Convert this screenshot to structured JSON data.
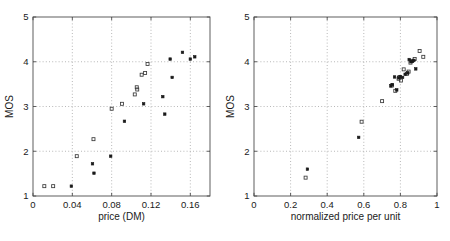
{
  "figure": {
    "title": "",
    "width": 450,
    "height": 241,
    "background": "#ffffff",
    "panel_count": 2
  },
  "chart_data": [
    {
      "type": "scatter",
      "id": "left-panel",
      "title": "",
      "xlabel": "price (DM)",
      "ylabel": "MOS",
      "xlim": [
        0,
        0.18
      ],
      "ylim": [
        1,
        5
      ],
      "xticks": [
        0,
        0.04,
        0.08,
        0.12,
        0.16
      ],
      "xticklabels": [
        "0",
        "0.04",
        "0.08",
        "0.12",
        "0.16"
      ],
      "yticks": [
        1,
        2,
        3,
        4,
        5
      ],
      "yticklabels": [
        "1",
        "2",
        "3",
        "4",
        "5"
      ],
      "grid": true,
      "legend": "none",
      "series": [
        {
          "name": "open-square",
          "marker": "square-open",
          "points": [
            {
              "x": 0.0115,
              "y": 1.22
            },
            {
              "x": 0.0205,
              "y": 1.22
            },
            {
              "x": 0.0445,
              "y": 1.89
            },
            {
              "x": 0.0615,
              "y": 2.27
            },
            {
              "x": 0.08,
              "y": 2.95
            },
            {
              "x": 0.0905,
              "y": 3.06
            },
            {
              "x": 0.1035,
              "y": 3.27
            },
            {
              "x": 0.1055,
              "y": 3.43
            },
            {
              "x": 0.106,
              "y": 3.38
            },
            {
              "x": 0.1105,
              "y": 3.71
            },
            {
              "x": 0.114,
              "y": 3.75
            },
            {
              "x": 0.1165,
              "y": 3.95
            }
          ]
        },
        {
          "name": "filled-dot",
          "marker": "square-filled",
          "points": [
            {
              "x": 0.039,
              "y": 1.22
            },
            {
              "x": 0.0605,
              "y": 1.72
            },
            {
              "x": 0.062,
              "y": 1.51
            },
            {
              "x": 0.079,
              "y": 1.89
            },
            {
              "x": 0.093,
              "y": 2.67
            },
            {
              "x": 0.1125,
              "y": 3.06
            },
            {
              "x": 0.132,
              "y": 3.22
            },
            {
              "x": 0.134,
              "y": 2.83
            },
            {
              "x": 0.1395,
              "y": 4.06
            },
            {
              "x": 0.1415,
              "y": 3.65
            },
            {
              "x": 0.152,
              "y": 4.21
            },
            {
              "x": 0.16,
              "y": 4.06
            },
            {
              "x": 0.1645,
              "y": 4.11
            }
          ]
        }
      ]
    },
    {
      "type": "scatter",
      "id": "right-panel",
      "title": "",
      "xlabel": "normalized price per unit",
      "ylabel": "MOS",
      "xlim": [
        0,
        1
      ],
      "ylim": [
        1,
        5
      ],
      "xticks": [
        0,
        0.2,
        0.4,
        0.6,
        0.8,
        1
      ],
      "xticklabels": [
        "0",
        "0.2",
        "0.4",
        "0.6",
        "0.8",
        "1"
      ],
      "yticks": [
        1,
        2,
        3,
        4,
        5
      ],
      "yticklabels": [
        "1",
        "2",
        "3",
        "4",
        "5"
      ],
      "grid": true,
      "legend": "none",
      "series": [
        {
          "name": "open-square",
          "marker": "square-open",
          "points": [
            {
              "x": 0.282,
              "y": 1.41
            },
            {
              "x": 0.588,
              "y": 2.66
            },
            {
              "x": 0.7,
              "y": 3.12
            },
            {
              "x": 0.754,
              "y": 3.47
            },
            {
              "x": 0.772,
              "y": 3.35
            },
            {
              "x": 0.79,
              "y": 3.62
            },
            {
              "x": 0.795,
              "y": 3.66
            },
            {
              "x": 0.803,
              "y": 3.58
            },
            {
              "x": 0.818,
              "y": 3.83
            },
            {
              "x": 0.836,
              "y": 3.73
            },
            {
              "x": 0.845,
              "y": 3.78
            },
            {
              "x": 0.855,
              "y": 3.98
            },
            {
              "x": 0.862,
              "y": 4.02
            },
            {
              "x": 0.878,
              "y": 4.06
            },
            {
              "x": 0.905,
              "y": 4.24
            },
            {
              "x": 0.925,
              "y": 4.11
            }
          ]
        },
        {
          "name": "filled-dot",
          "marker": "square-filled",
          "points": [
            {
              "x": 0.292,
              "y": 1.6
            },
            {
              "x": 0.572,
              "y": 2.31
            },
            {
              "x": 0.748,
              "y": 3.46
            },
            {
              "x": 0.756,
              "y": 3.49
            },
            {
              "x": 0.768,
              "y": 3.66
            },
            {
              "x": 0.78,
              "y": 3.37
            },
            {
              "x": 0.792,
              "y": 3.64
            },
            {
              "x": 0.8,
              "y": 3.67
            },
            {
              "x": 0.812,
              "y": 3.65
            },
            {
              "x": 0.826,
              "y": 3.72
            },
            {
              "x": 0.84,
              "y": 3.75
            },
            {
              "x": 0.848,
              "y": 4.05
            },
            {
              "x": 0.858,
              "y": 4.0
            },
            {
              "x": 0.866,
              "y": 4.01
            },
            {
              "x": 0.874,
              "y": 4.03
            },
            {
              "x": 0.884,
              "y": 3.84
            }
          ]
        }
      ]
    }
  ]
}
